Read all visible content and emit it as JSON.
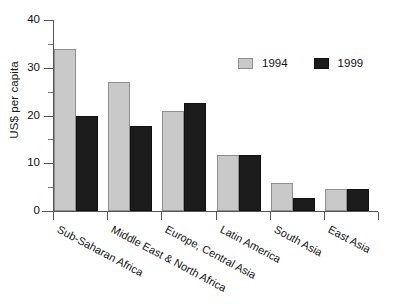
{
  "chart_data": {
    "type": "bar",
    "title": "",
    "subtitle": "",
    "xlabel": "",
    "ylabel": "US$ per capita",
    "ylim": [
      0,
      40
    ],
    "y_ticks": [
      0,
      10,
      20,
      30,
      40
    ],
    "y_tick_labels": [
      "0",
      "10",
      "20",
      "30",
      "40"
    ],
    "y_minor_ticks": [
      5,
      15,
      25,
      35
    ],
    "grid": false,
    "legend_position": "upper right",
    "categories": [
      "Sub-Saharan Africa",
      "Middle East & North Africa",
      "Europe, Central Asia",
      "Latin America",
      "South Asia",
      "East Asia"
    ],
    "series": [
      {
        "name": "1994",
        "color": "#c9c9c9",
        "values": [
          34,
          27,
          21,
          11.8,
          5.8,
          4.7
        ]
      },
      {
        "name": "1999",
        "color": "#1c1c1c",
        "values": [
          20,
          17.8,
          22.7,
          11.8,
          2.7,
          4.6
        ]
      }
    ]
  }
}
